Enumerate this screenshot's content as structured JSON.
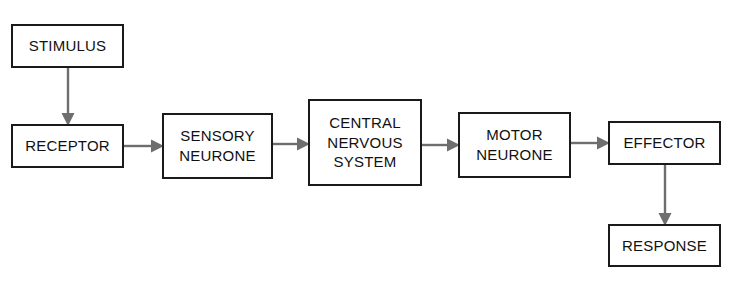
{
  "diagram": {
    "ghost_caption": "",
    "colors": {
      "background": "#ffffff",
      "box_border": "#1a1a1a",
      "box_fill": "#ffffff",
      "text": "#111111",
      "arrow": "#6e6e6e"
    },
    "nodes": [
      {
        "id": "stimulus",
        "label": "STIMULUS",
        "x": 11,
        "y": 24,
        "w": 113,
        "h": 44
      },
      {
        "id": "receptor",
        "label": "RECEPTOR",
        "x": 11,
        "y": 124,
        "w": 113,
        "h": 44
      },
      {
        "id": "sensory-neurone",
        "label": "SENSORY\nNEURONE",
        "x": 162,
        "y": 113,
        "w": 111,
        "h": 66
      },
      {
        "id": "cns",
        "label": "CENTRAL\nNERVOUS\nSYSTEM",
        "x": 308,
        "y": 99,
        "w": 114,
        "h": 87
      },
      {
        "id": "motor-neurone",
        "label": "MOTOR\nNEURONE",
        "x": 458,
        "y": 112,
        "w": 113,
        "h": 66
      },
      {
        "id": "effector",
        "label": "EFFECTOR",
        "x": 608,
        "y": 121,
        "w": 113,
        "h": 44
      },
      {
        "id": "response",
        "label": "RESPONSE",
        "x": 608,
        "y": 224,
        "w": 113,
        "h": 43
      }
    ],
    "connectors": [
      {
        "id": "stimulus-to-receptor",
        "from": "stimulus",
        "to": "receptor",
        "direction": "down",
        "x": 60,
        "y": 66,
        "w": 16,
        "h": 60
      },
      {
        "id": "receptor-to-sensory-neurone",
        "from": "receptor",
        "to": "sensory-neurone",
        "direction": "right",
        "x": 122,
        "y": 138,
        "w": 42,
        "h": 16
      },
      {
        "id": "sensory-neurone-to-cns",
        "from": "sensory-neurone",
        "to": "cns",
        "direction": "right",
        "x": 271,
        "y": 136,
        "w": 39,
        "h": 16
      },
      {
        "id": "cns-to-motor-neurone",
        "from": "cns",
        "to": "motor-neurone",
        "direction": "right",
        "x": 420,
        "y": 137,
        "w": 40,
        "h": 16
      },
      {
        "id": "motor-neurone-to-effector",
        "from": "motor-neurone",
        "to": "effector",
        "direction": "right",
        "x": 569,
        "y": 135,
        "w": 41,
        "h": 16
      },
      {
        "id": "effector-to-response",
        "from": "effector",
        "to": "response",
        "direction": "down",
        "x": 657,
        "y": 163,
        "w": 16,
        "h": 63
      }
    ]
  }
}
